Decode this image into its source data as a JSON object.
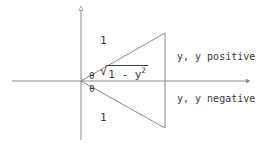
{
  "figure": {
    "axes": {
      "x_axis_name": "horizontal-axis",
      "y_axis_name": "vertical-axis"
    },
    "labels": {
      "one_top": "1",
      "one_bottom": "1",
      "theta_top": "θ",
      "theta_bottom": "θ",
      "radical_symbol": "√",
      "radicand_base": "1 - y",
      "radicand_exponent": "2",
      "quadrant_positive": "y, y positive",
      "quadrant_negative": "y, y negative"
    },
    "colors": {
      "background": "#ffffff",
      "axis": "#8a8a8a",
      "triangle": "#7a7a7a",
      "text": "#3a3a3a"
    },
    "geometry": {
      "origin_x": 81,
      "origin_y": 81,
      "apex_top_x": 165,
      "apex_top_y": 33,
      "apex_bottom_x": 165,
      "apex_bottom_y": 128,
      "x_axis_start": 12,
      "x_axis_end": 248,
      "y_axis_top": 8,
      "y_axis_bottom": 140
    }
  }
}
